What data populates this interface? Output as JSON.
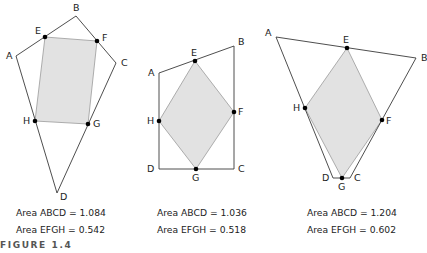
{
  "figure_label": "FIGURE 1.4",
  "panels": [
    {
      "outer": {
        "A": [
          16,
          56
        ],
        "B": [
          76,
          16
        ],
        "C": [
          116,
          63
        ],
        "D": [
          57,
          193
        ]
      },
      "inner": {
        "E": [
          45,
          37
        ],
        "F": [
          97,
          41
        ],
        "G": [
          88,
          124
        ],
        "H": [
          35,
          121
        ]
      },
      "labels": {
        "A": "A",
        "B": "B",
        "C": "C",
        "D": "D",
        "E": "E",
        "F": "F",
        "G": "G",
        "H": "H"
      },
      "area_abcd": "Area ABCD = 1.084",
      "area_efgh": "Area EFGH = 0.542"
    },
    {
      "outer": {
        "A": [
          159,
          73
        ],
        "B": [
          234,
          46
        ],
        "C": [
          234,
          169
        ],
        "D": [
          159,
          169
        ]
      },
      "inner": {
        "E": [
          195,
          61
        ],
        "F": [
          234,
          112
        ],
        "G": [
          196,
          169
        ],
        "H": [
          159,
          121
        ]
      },
      "labels": {
        "A": "A",
        "B": "B",
        "C": "C",
        "D": "D",
        "E": "E",
        "F": "F",
        "G": "G",
        "H": "H"
      },
      "area_abcd": "Area ABCD = 1.036",
      "area_efgh": "Area EFGH = 0.518"
    },
    {
      "outer": {
        "A": [
          276,
          37
        ],
        "B": [
          416,
          58
        ],
        "C": [
          350,
          178
        ],
        "D": [
          333,
          178
        ]
      },
      "inner": {
        "E": [
          347,
          48
        ],
        "F": [
          382,
          120
        ],
        "G": [
          342,
          178
        ],
        "H": [
          305,
          108
        ]
      },
      "labels": {
        "A": "A",
        "B": "B",
        "C": "C",
        "D": "D",
        "E": "E",
        "F": "F",
        "G": "G",
        "H": "H"
      },
      "area_abcd": "Area ABCD = 1.204",
      "area_efgh": "Area EFGH = 0.602"
    }
  ]
}
